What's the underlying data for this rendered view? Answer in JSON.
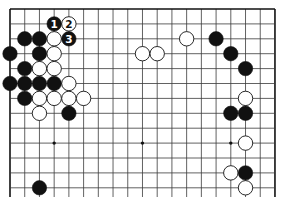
{
  "board": {
    "columns": 19,
    "visible_rows": 13,
    "origin_x": 10,
    "origin_y": 9,
    "spacing_x": 14.72,
    "spacing_y": 14.9,
    "bottom_y": 197,
    "line_color": "#3a3a3a",
    "edge_color": "#111111",
    "background": "#ffffff"
  },
  "star_points": [
    [
      3,
      9
    ],
    [
      9,
      9
    ],
    [
      15,
      9
    ]
  ],
  "stones": {
    "black": [
      {
        "col": 3,
        "row": 1,
        "label": "1"
      },
      {
        "col": 4,
        "row": 2,
        "label": "3"
      },
      {
        "col": 1,
        "row": 2
      },
      {
        "col": 2,
        "row": 2
      },
      {
        "col": 0,
        "row": 3
      },
      {
        "col": 2,
        "row": 3
      },
      {
        "col": 1,
        "row": 4
      },
      {
        "col": 0,
        "row": 5
      },
      {
        "col": 1,
        "row": 5
      },
      {
        "col": 2,
        "row": 5
      },
      {
        "col": 3,
        "row": 5
      },
      {
        "col": 1,
        "row": 6
      },
      {
        "col": 4,
        "row": 7
      },
      {
        "col": 14,
        "row": 2
      },
      {
        "col": 15,
        "row": 3
      },
      {
        "col": 16,
        "row": 4
      },
      {
        "col": 15,
        "row": 7
      },
      {
        "col": 16,
        "row": 7
      },
      {
        "col": 16,
        "row": 11
      },
      {
        "col": 2,
        "row": 12
      }
    ],
    "white": [
      {
        "col": 4,
        "row": 1,
        "label": "2"
      },
      {
        "col": 3,
        "row": 2
      },
      {
        "col": 3,
        "row": 3
      },
      {
        "col": 2,
        "row": 4
      },
      {
        "col": 3,
        "row": 4
      },
      {
        "col": 4,
        "row": 5
      },
      {
        "col": 2,
        "row": 6
      },
      {
        "col": 3,
        "row": 6
      },
      {
        "col": 4,
        "row": 6
      },
      {
        "col": 5,
        "row": 6
      },
      {
        "col": 2,
        "row": 7
      },
      {
        "col": 9,
        "row": 3
      },
      {
        "col": 10,
        "row": 3
      },
      {
        "col": 12,
        "row": 2
      },
      {
        "col": 16,
        "row": 6
      },
      {
        "col": 16,
        "row": 9
      },
      {
        "col": 15,
        "row": 11
      },
      {
        "col": 16,
        "row": 12
      }
    ]
  }
}
